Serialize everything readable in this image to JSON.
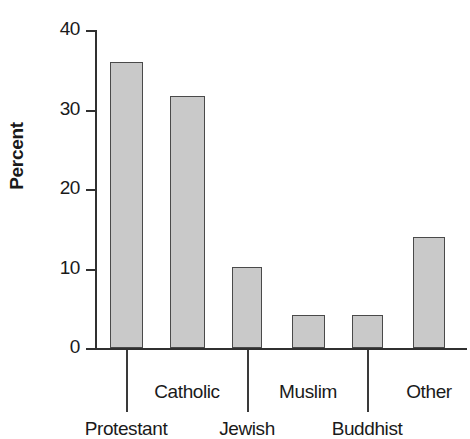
{
  "chart_data": {
    "type": "bar",
    "title": "",
    "xlabel": "",
    "ylabel": "Percent",
    "ylim": [
      0,
      40
    ],
    "yticks": [
      0,
      10,
      20,
      30,
      40
    ],
    "ytick_labels": [
      "0",
      "10",
      "20",
      "30",
      "40"
    ],
    "grid": false,
    "legend": null,
    "bar_fill_color": "#c9c9c9",
    "bar_edge_color": "#4a4a4a",
    "axis_color": "#303030",
    "categories": [
      "Protestant",
      "Catholic",
      "Jewish",
      "Muslim",
      "Buddhist",
      "Other"
    ],
    "values": [
      36.0,
      31.7,
      10.2,
      4.1,
      4.1,
      14.0
    ],
    "label_rows": [
      "bottom",
      "top",
      "bottom",
      "top",
      "bottom",
      "top"
    ]
  },
  "axis": {
    "y_title": "Percent"
  }
}
